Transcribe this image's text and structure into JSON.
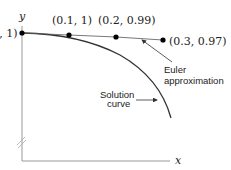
{
  "axes": {
    "x_label": "x",
    "y_label": "y"
  },
  "points": [
    {
      "label": "(0, 1)",
      "x": 0.0,
      "y": 1.0
    },
    {
      "label": "(0.1, 1)",
      "x": 0.1,
      "y": 1.0
    },
    {
      "label": "(0.2, 0.99)",
      "x": 0.2,
      "y": 0.99
    },
    {
      "label": "(0.3, 0.97)",
      "x": 0.3,
      "y": 0.97
    }
  ],
  "annotations": {
    "euler_line1": "Euler",
    "euler_line2": "approximation",
    "solution_line1": "Solution",
    "solution_line2": "curve"
  },
  "colors": {
    "line": "#333333",
    "axis": "#999999",
    "point": "#000000"
  }
}
